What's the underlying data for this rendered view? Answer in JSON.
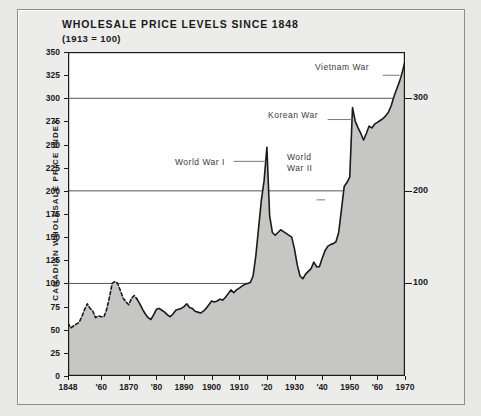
{
  "figure": {
    "title": "WHOLESALE PRICE LEVELS SINCE 1848",
    "subtitle": "(1913 = 100)",
    "ylabel": "CANADIAN WHOLESALE PRICE INDEX",
    "background_color": "#e8e8e6",
    "fill_color": "#c6c6c4",
    "line_color": "#1a1a1a"
  },
  "chart_data": {
    "type": "area",
    "title": "WHOLESALE PRICE LEVELS SINCE 1848",
    "subtitle": "(1913 = 100)",
    "xlabel": "",
    "ylabel": "CANADIAN WHOLESALE PRICE INDEX",
    "xlim": [
      1848,
      1970
    ],
    "ylim": [
      0,
      350
    ],
    "grid": "horizontal-major-only",
    "legend": "none",
    "ytick_labels": [
      "0",
      "25",
      "50",
      "75",
      "100",
      "125",
      "150",
      "175",
      "200",
      "225",
      "250",
      "275",
      "300",
      "325",
      "350"
    ],
    "ytick_values": [
      0,
      25,
      50,
      75,
      100,
      125,
      150,
      175,
      200,
      225,
      250,
      275,
      300,
      325,
      350
    ],
    "ytick_labels_right": [
      "100",
      "200",
      "300"
    ],
    "ytick_values_right": [
      100,
      200,
      300
    ],
    "gridline_values": [
      100,
      200,
      300
    ],
    "xtick_labels": [
      "1848",
      "'60",
      "1870",
      "'80",
      "1890",
      "1900",
      "1910",
      "'20",
      "1930",
      "'40",
      "1950",
      "'60",
      "1970"
    ],
    "xtick_values": [
      1848,
      1860,
      1870,
      1880,
      1890,
      1900,
      1910,
      1920,
      1930,
      1940,
      1950,
      1960,
      1970
    ],
    "line_style_segments": [
      {
        "style": "dashed",
        "from": 1848,
        "to": 1873
      },
      {
        "style": "solid",
        "from": 1873,
        "to": 1970
      }
    ],
    "x": [
      1848,
      1849,
      1850,
      1851,
      1852,
      1853,
      1854,
      1855,
      1856,
      1857,
      1858,
      1859,
      1860,
      1861,
      1862,
      1863,
      1864,
      1865,
      1866,
      1867,
      1868,
      1869,
      1870,
      1871,
      1872,
      1873,
      1874,
      1875,
      1876,
      1877,
      1878,
      1879,
      1880,
      1881,
      1882,
      1883,
      1884,
      1885,
      1886,
      1887,
      1888,
      1889,
      1890,
      1891,
      1892,
      1893,
      1894,
      1895,
      1896,
      1897,
      1898,
      1899,
      1900,
      1901,
      1902,
      1903,
      1904,
      1905,
      1906,
      1907,
      1908,
      1909,
      1910,
      1911,
      1912,
      1913,
      1914,
      1915,
      1916,
      1917,
      1918,
      1919,
      1920,
      1921,
      1922,
      1923,
      1924,
      1925,
      1926,
      1927,
      1928,
      1929,
      1930,
      1931,
      1932,
      1933,
      1934,
      1935,
      1936,
      1937,
      1938,
      1939,
      1940,
      1941,
      1942,
      1943,
      1944,
      1945,
      1946,
      1947,
      1948,
      1949,
      1950,
      1951,
      1952,
      1953,
      1954,
      1955,
      1956,
      1957,
      1958,
      1959,
      1960,
      1961,
      1962,
      1963,
      1964,
      1965,
      1966,
      1967,
      1968,
      1969,
      1970
    ],
    "values": [
      57,
      52,
      54,
      56,
      58,
      64,
      72,
      78,
      73,
      70,
      63,
      65,
      64,
      64,
      72,
      85,
      100,
      102,
      100,
      92,
      84,
      80,
      77,
      84,
      87,
      83,
      78,
      72,
      67,
      63,
      61,
      66,
      72,
      73,
      71,
      69,
      66,
      64,
      67,
      71,
      72,
      73,
      75,
      78,
      74,
      73,
      70,
      69,
      68,
      70,
      73,
      77,
      81,
      80,
      81,
      83,
      82,
      85,
      89,
      93,
      90,
      93,
      95,
      97,
      99,
      100,
      101,
      108,
      130,
      160,
      190,
      211,
      247,
      173,
      155,
      152,
      155,
      158,
      156,
      154,
      152,
      150,
      137,
      120,
      108,
      105,
      110,
      113,
      116,
      123,
      118,
      118,
      127,
      135,
      140,
      142,
      143,
      145,
      155,
      180,
      205,
      209,
      215,
      290,
      275,
      268,
      262,
      255,
      262,
      270,
      268,
      272,
      274,
      276,
      278,
      281,
      285,
      292,
      302,
      310,
      318,
      328,
      340
    ],
    "annotations": [
      {
        "text": "World War I",
        "target_year": 1920,
        "target_value": 247
      },
      {
        "text": "World War II",
        "text_lines": [
          "World",
          "War II"
        ],
        "target_year": 1941,
        "target_value": 200
      },
      {
        "text": "Korean War",
        "target_year": 1951,
        "target_value": 290
      },
      {
        "text": "Vietnam War",
        "target_year": 1968,
        "target_value": 328
      }
    ]
  },
  "annotations": {
    "world_war_1": "World War I",
    "world_war_2_line1": "World",
    "world_war_2_line2": "War II",
    "korean_war": "Korean War",
    "vietnam_war": "Vietnam War"
  }
}
